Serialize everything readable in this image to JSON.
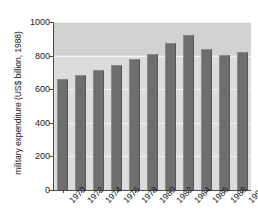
{
  "chart_data": {
    "type": "bar",
    "title": "",
    "xlabel": "",
    "ylabel": "military expenditure (US$ billion, 1988)",
    "categories": [
      "1970",
      "1972",
      "1974",
      "1976",
      "1978",
      "1980",
      "1982",
      "1984",
      "1986",
      "1988",
      "1990"
    ],
    "values": [
      660,
      685,
      715,
      745,
      780,
      810,
      875,
      920,
      840,
      805,
      820
    ],
    "ylim": [
      0,
      1000
    ],
    "yticks": [
      0,
      200,
      400,
      600,
      800,
      1000
    ],
    "ytick_labels": [
      "0",
      "200",
      "400",
      "600",
      "800",
      "1000"
    ],
    "grid": true,
    "legend": "none",
    "colors": {
      "bar_fill": "#6e6e6e",
      "bar_highlight": "#8a8a8a",
      "bar_shadow": "#555555",
      "plot_background": "#dcdcdc",
      "plot_background_top_band": "#d2d2d2",
      "gridline": "#f5f5f5",
      "axis": "#4a4a4a",
      "text": "#1a1a1a",
      "page_background": "#ffffff"
    }
  }
}
